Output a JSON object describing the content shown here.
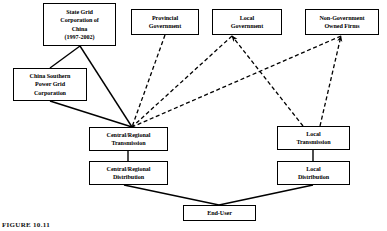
{
  "figure": {
    "caption": "FIGURE 10.11",
    "colors": {
      "line": "#000000",
      "box_border": "#000000",
      "background": "#ffffff"
    }
  },
  "nodes": [
    {
      "id": "state-grid",
      "label": "State Grid\nCorporation of\nChina\n(1997-2002)",
      "x": 43,
      "y": 3,
      "w": 73,
      "h": 43
    },
    {
      "id": "provincial-gov",
      "label": "Provincial\nGovernment",
      "x": 131,
      "y": 9,
      "w": 68,
      "h": 26
    },
    {
      "id": "local-gov",
      "label": "Local\nGovernment",
      "x": 212,
      "y": 9,
      "w": 70,
      "h": 26
    },
    {
      "id": "non-gov-firms",
      "label": "Non-Government\nOwned Firms",
      "x": 305,
      "y": 9,
      "w": 74,
      "h": 26
    },
    {
      "id": "china-southern",
      "label": "China Southern\nPower Grid\nCorporation",
      "x": 13,
      "y": 68,
      "w": 74,
      "h": 33
    },
    {
      "id": "central-trans",
      "label": "Central/Regional\nTransmission",
      "x": 89,
      "y": 127,
      "w": 79,
      "h": 24
    },
    {
      "id": "central-dist",
      "label": "Central/Regional\nDistribution",
      "x": 89,
      "y": 161,
      "w": 79,
      "h": 24
    },
    {
      "id": "local-trans",
      "label": "Local\nTransmission",
      "x": 277,
      "y": 126,
      "w": 73,
      "h": 24
    },
    {
      "id": "local-dist",
      "label": "Local\nDistribution",
      "x": 277,
      "y": 161,
      "w": 73,
      "h": 24
    },
    {
      "id": "end-user",
      "label": "End-User",
      "x": 183,
      "y": 205,
      "w": 73,
      "h": 16
    }
  ],
  "edges": [
    {
      "id": "state-grid-to-china-southern",
      "style": "solid",
      "arrow": false,
      "points": "80,46 50,68"
    },
    {
      "id": "state-grid-to-central-trans",
      "style": "solid",
      "arrow": false,
      "points": "80,46 132,127"
    },
    {
      "id": "china-southern-to-central-trans",
      "style": "solid",
      "arrow": false,
      "points": "50,101 132,127"
    },
    {
      "id": "provincial-gov-to-central-trans",
      "style": "dashed",
      "arrow": false,
      "points": "165,35 132,127"
    },
    {
      "id": "local-gov-to-central-trans",
      "style": "dashed",
      "arrow": false,
      "points": "232,36 132,127"
    },
    {
      "id": "non-gov-firms-to-central-trans",
      "style": "dashed",
      "arrow": false,
      "points": "341,36 132,127"
    },
    {
      "id": "local-trans-to-local-gov",
      "style": "dashed",
      "arrow": true,
      "points": "303,126 232,36"
    },
    {
      "id": "local-trans-to-non-gov-firms",
      "style": "dashed",
      "arrow": true,
      "points": "320,126 341,36"
    },
    {
      "id": "central-trans-to-central-dist",
      "style": "solid",
      "arrow": false,
      "points": "128,151 128,161"
    },
    {
      "id": "local-trans-to-local-dist",
      "style": "solid",
      "arrow": false,
      "points": "313,150 313,161"
    },
    {
      "id": "central-dist-to-end-user",
      "style": "solid",
      "arrow": false,
      "points": "124,185 219,205"
    },
    {
      "id": "local-dist-to-end-user",
      "style": "solid",
      "arrow": false,
      "points": "313,185 219,205"
    }
  ]
}
